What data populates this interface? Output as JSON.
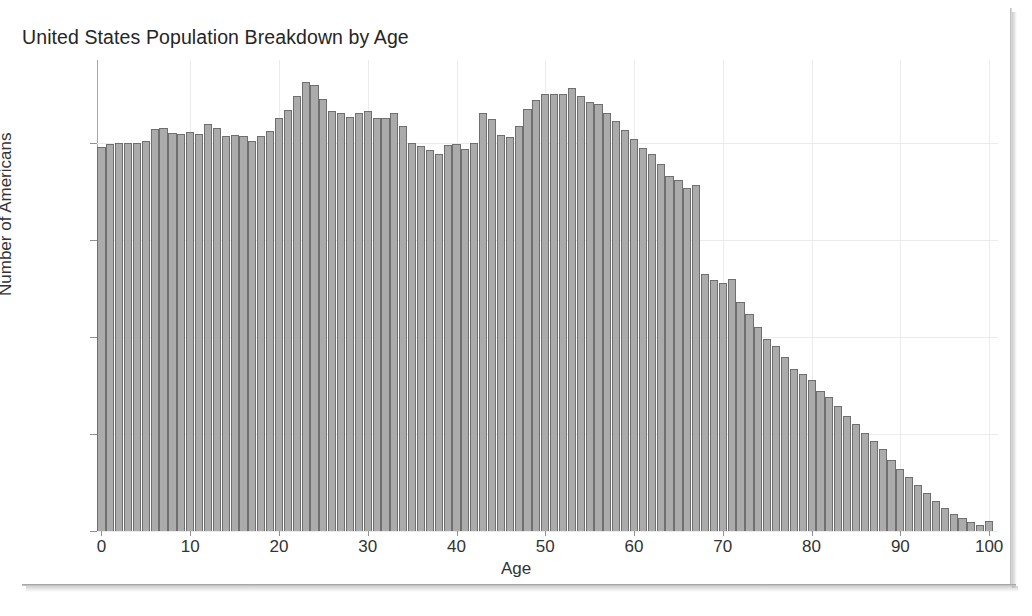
{
  "chart_data": {
    "type": "bar",
    "title": "United States Population Breakdown by Age",
    "xlabel": "Age",
    "ylabel": "Number of Americans",
    "xlim": [
      -0.5,
      101
    ],
    "ylim": [
      0,
      4.85
    ],
    "grid": true,
    "legend": null,
    "units": "millions",
    "y_tick_labels": [
      "0M",
      "1M",
      "2M",
      "3M",
      "4M"
    ],
    "y_tick_values": [
      0,
      1,
      2,
      3,
      4
    ],
    "x_tick_labels": [
      "0",
      "10",
      "20",
      "30",
      "40",
      "50",
      "60",
      "70",
      "80",
      "90",
      "100"
    ],
    "x_tick_values": [
      0,
      10,
      20,
      30,
      40,
      50,
      60,
      70,
      80,
      90,
      100
    ],
    "bar_color": "#ababab",
    "bar_edge_color": "#6f6f6f",
    "categories": [
      0,
      1,
      2,
      3,
      4,
      5,
      6,
      7,
      8,
      9,
      10,
      11,
      12,
      13,
      14,
      15,
      16,
      17,
      18,
      19,
      20,
      21,
      22,
      23,
      24,
      25,
      26,
      27,
      28,
      29,
      30,
      31,
      32,
      33,
      34,
      35,
      36,
      37,
      38,
      39,
      40,
      41,
      42,
      43,
      44,
      45,
      46,
      47,
      48,
      49,
      50,
      51,
      52,
      53,
      54,
      55,
      56,
      57,
      58,
      59,
      60,
      61,
      62,
      63,
      64,
      65,
      66,
      67,
      68,
      69,
      70,
      71,
      72,
      73,
      74,
      75,
      76,
      77,
      78,
      79,
      80,
      81,
      82,
      83,
      84,
      85,
      86,
      87,
      88,
      89,
      90,
      91,
      92,
      93,
      94,
      95,
      96,
      97,
      98,
      99,
      100
    ],
    "values": [
      3.95,
      3.99,
      4.0,
      4.0,
      4.0,
      4.02,
      4.14,
      4.15,
      4.1,
      4.09,
      4.11,
      4.09,
      4.19,
      4.15,
      4.07,
      4.08,
      4.07,
      4.02,
      4.07,
      4.12,
      4.25,
      4.34,
      4.48,
      4.62,
      4.59,
      4.45,
      4.32,
      4.3,
      4.26,
      4.3,
      4.32,
      4.25,
      4.25,
      4.3,
      4.17,
      4.0,
      3.96,
      3.92,
      3.88,
      3.97,
      3.99,
      3.93,
      4.0,
      4.3,
      4.24,
      4.08,
      4.06,
      4.17,
      4.35,
      4.44,
      4.5,
      4.5,
      4.5,
      4.56,
      4.48,
      4.42,
      4.4,
      4.3,
      4.22,
      4.13,
      4.04,
      3.94,
      3.88,
      3.78,
      3.66,
      3.61,
      3.53,
      3.56,
      2.65,
      2.58,
      2.55,
      2.6,
      2.36,
      2.23,
      2.1,
      1.98,
      1.9,
      1.79,
      1.67,
      1.62,
      1.55,
      1.44,
      1.38,
      1.29,
      1.18,
      1.1,
      1.01,
      0.93,
      0.84,
      0.73,
      0.64,
      0.56,
      0.47,
      0.39,
      0.31,
      0.24,
      0.18,
      0.13,
      0.09,
      0.06,
      0.1
    ]
  }
}
